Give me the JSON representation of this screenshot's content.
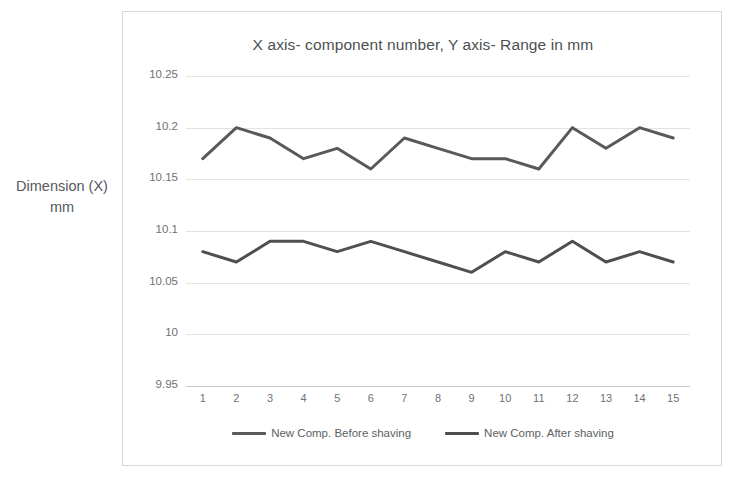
{
  "chart_data": {
    "type": "line",
    "title": "X axis- component number, Y axis- Range in mm",
    "xlabel": "",
    "ylabel": "Dimension (X) mm",
    "ylim": [
      9.95,
      10.25
    ],
    "ytick_labels": [
      "9.95",
      "10",
      "10.05",
      "10.1",
      "10.15",
      "10.2",
      "10.25"
    ],
    "ytick_values": [
      9.95,
      10.0,
      10.05,
      10.1,
      10.15,
      10.2,
      10.25
    ],
    "grid": true,
    "legend_position": "bottom",
    "categories": [
      "1",
      "2",
      "3",
      "4",
      "5",
      "6",
      "7",
      "8",
      "9",
      "10",
      "11",
      "12",
      "13",
      "14",
      "15"
    ],
    "x": [
      1,
      2,
      3,
      4,
      5,
      6,
      7,
      8,
      9,
      10,
      11,
      12,
      13,
      14,
      15
    ],
    "series": [
      {
        "name": "New Comp. Before shaving",
        "color": "#595959",
        "values": [
          10.17,
          10.2,
          10.19,
          10.17,
          10.18,
          10.16,
          10.19,
          10.18,
          10.17,
          10.17,
          10.16,
          10.2,
          10.18,
          10.2,
          10.19
        ]
      },
      {
        "name": "New Comp. After shaving",
        "color": "#4f4f4f",
        "values": [
          10.08,
          10.07,
          10.09,
          10.09,
          10.08,
          10.09,
          10.08,
          10.07,
          10.06,
          10.08,
          10.07,
          10.09,
          10.07,
          10.08,
          10.07
        ]
      }
    ]
  },
  "axis_title_y": {
    "line1": "Dimension (X)",
    "line2": "mm"
  }
}
